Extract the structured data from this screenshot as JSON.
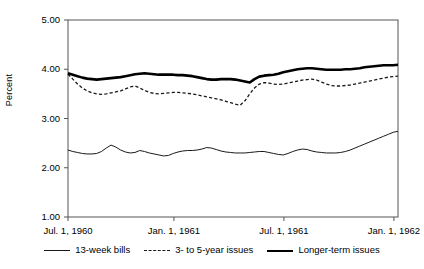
{
  "chart_data": {
    "type": "line",
    "title": "",
    "subtitle": "",
    "xlabel": "",
    "ylabel": "Percent",
    "ylim": [
      1.0,
      5.0
    ],
    "ytick_labels": [
      "5.00",
      "4.00",
      "3.00",
      "2.00",
      "1.00"
    ],
    "ytick_values": [
      5.0,
      4.0,
      3.0,
      2.0,
      1.0
    ],
    "xtick_labels": [
      "Jul. 1, 1960",
      "Jan. 1, 1961",
      "Jul. 1, 1961",
      "Jan. 1, 1962"
    ],
    "xtick_values": [
      0,
      26,
      53,
      80
    ],
    "xlim": [
      0,
      81
    ],
    "grid": false,
    "legend_position": "bottom",
    "line_color": "#1a1a1a",
    "series": [
      {
        "name": "13-week bills",
        "style": "thin-solid",
        "color": "#1a1a1a",
        "values": [
          2.36,
          2.33,
          2.31,
          2.29,
          2.28,
          2.28,
          2.29,
          2.33,
          2.4,
          2.46,
          2.42,
          2.36,
          2.32,
          2.3,
          2.31,
          2.35,
          2.33,
          2.3,
          2.28,
          2.26,
          2.24,
          2.25,
          2.29,
          2.32,
          2.34,
          2.35,
          2.35,
          2.36,
          2.38,
          2.41,
          2.4,
          2.37,
          2.34,
          2.32,
          2.31,
          2.3,
          2.3,
          2.3,
          2.31,
          2.32,
          2.33,
          2.33,
          2.31,
          2.29,
          2.27,
          2.26,
          2.29,
          2.33,
          2.36,
          2.38,
          2.37,
          2.34,
          2.32,
          2.31,
          2.3,
          2.3,
          2.3,
          2.31,
          2.33,
          2.36,
          2.4,
          2.44,
          2.48,
          2.52,
          2.56,
          2.6,
          2.64,
          2.68,
          2.72,
          2.74
        ]
      },
      {
        "name": "3- to 5-year issues",
        "style": "dashed",
        "color": "#1a1a1a",
        "values": [
          3.9,
          3.8,
          3.7,
          3.62,
          3.56,
          3.52,
          3.5,
          3.49,
          3.5,
          3.52,
          3.54,
          3.56,
          3.6,
          3.64,
          3.66,
          3.62,
          3.57,
          3.53,
          3.51,
          3.5,
          3.51,
          3.52,
          3.53,
          3.53,
          3.52,
          3.51,
          3.5,
          3.48,
          3.46,
          3.44,
          3.42,
          3.4,
          3.38,
          3.35,
          3.32,
          3.29,
          3.27,
          3.36,
          3.5,
          3.62,
          3.7,
          3.73,
          3.72,
          3.7,
          3.69,
          3.7,
          3.72,
          3.74,
          3.76,
          3.78,
          3.79,
          3.8,
          3.78,
          3.74,
          3.7,
          3.67,
          3.66,
          3.66,
          3.67,
          3.68,
          3.7,
          3.72,
          3.74,
          3.76,
          3.78,
          3.8,
          3.82,
          3.84,
          3.85,
          3.86
        ]
      },
      {
        "name": "Longer-term issues",
        "style": "thick-solid",
        "color": "#000000",
        "values": [
          3.92,
          3.89,
          3.86,
          3.83,
          3.81,
          3.8,
          3.79,
          3.8,
          3.81,
          3.82,
          3.83,
          3.84,
          3.86,
          3.88,
          3.9,
          3.91,
          3.92,
          3.91,
          3.9,
          3.89,
          3.89,
          3.89,
          3.89,
          3.88,
          3.88,
          3.87,
          3.86,
          3.84,
          3.82,
          3.8,
          3.79,
          3.79,
          3.8,
          3.8,
          3.8,
          3.79,
          3.77,
          3.75,
          3.73,
          3.8,
          3.85,
          3.87,
          3.88,
          3.89,
          3.91,
          3.94,
          3.96,
          3.98,
          4.0,
          4.01,
          4.02,
          4.02,
          4.01,
          4.0,
          3.99,
          3.99,
          3.99,
          3.99,
          4.0,
          4.0,
          4.01,
          4.02,
          4.04,
          4.05,
          4.06,
          4.07,
          4.08,
          4.08,
          4.08,
          4.09
        ]
      }
    ]
  },
  "legend": {
    "items": [
      {
        "label": "13-week bills"
      },
      {
        "label": "3- to 5-year issues"
      },
      {
        "label": "Longer-term issues"
      }
    ]
  }
}
